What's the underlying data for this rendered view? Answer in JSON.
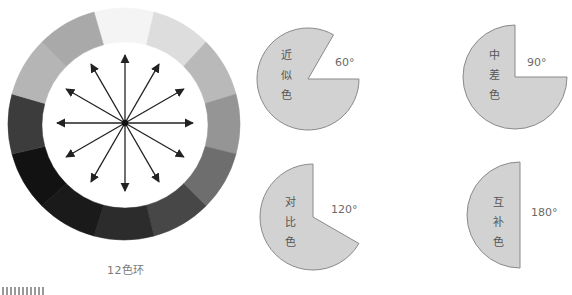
{
  "color_wheel": {
    "caption": "12色环",
    "segments": 12,
    "segment_colors": [
      "#f4f4f4",
      "#dddddd",
      "#b9b9b9",
      "#959595",
      "#6e6e6e",
      "#474747",
      "#2c2c2c",
      "#1a1a1a",
      "#121212",
      "#3c3c3c",
      "#b5b5b5",
      "#a9a9a9"
    ],
    "arrow_count": 12
  },
  "pies": [
    {
      "label_chars": [
        "近",
        "似",
        "色"
      ],
      "angle": "60°",
      "gap_degrees": 60,
      "name": "analogous"
    },
    {
      "label_chars": [
        "中",
        "差",
        "色"
      ],
      "angle": "90°",
      "gap_degrees": 90,
      "name": "medium-difference"
    },
    {
      "label_chars": [
        "对",
        "比",
        "色"
      ],
      "angle": "120°",
      "gap_degrees": 120,
      "name": "contrast"
    },
    {
      "label_chars": [
        "互",
        "补",
        "色"
      ],
      "angle": "180°",
      "gap_degrees": 180,
      "name": "complementary"
    }
  ],
  "colors": {
    "pie_fill": "#d2d2d2",
    "pie_stroke": "#8a8a8a",
    "arrow": "#222222"
  }
}
